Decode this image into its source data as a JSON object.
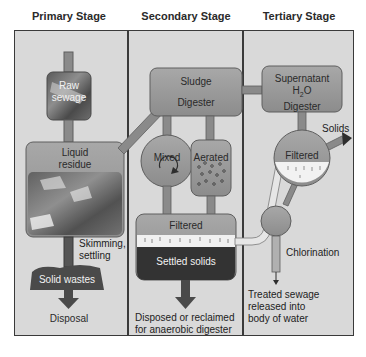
{
  "stages": {
    "primary": {
      "title": "Primary Stage",
      "raw_sewage_line1": "Raw",
      "raw_sewage_line2": "sewage",
      "liquid_residue_line1": "Liquid",
      "liquid_residue_line2": "residue",
      "skimming_line1": "Skimming,",
      "skimming_line2": "settling",
      "solid_wastes": "Solid wastes",
      "disposal": "Disposal"
    },
    "secondary": {
      "title": "Secondary Stage",
      "sludge": "Sludge",
      "digester": "Digester",
      "mixed": "Mixed",
      "aerated": "Aerated",
      "filtered": "Filtered",
      "settled_solids": "Settled solids",
      "disposed_line1": "Disposed or reclaimed",
      "disposed_line2": "for anaerobic digester"
    },
    "tertiary": {
      "title": "Tertiary Stage",
      "supernatant": "Supernatant",
      "h2o_h": "H",
      "h2o_sub": "2",
      "h2o_o": "O",
      "digester": "Digester",
      "solids": "Solids",
      "filtered": "Filtered",
      "chlorination": "Chlorination",
      "treated_line1": "Treated sewage",
      "treated_line2": "released into",
      "treated_line3": "body of water"
    }
  },
  "colors": {
    "panel_bg": "#d9d9d9",
    "vessel_fill": "#9a9a9a",
    "vessel_stroke": "#5e5e5e",
    "pipe": "#8a8a8a",
    "dark_solids": "#333333"
  }
}
